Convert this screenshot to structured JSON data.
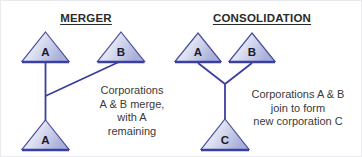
{
  "figure": {
    "title_left": "MERGER",
    "title_right": "CONSOLIDATION"
  },
  "colors": {
    "triangle_fill_light": "#e6e8f5",
    "triangle_fill_dark": "#aab0da",
    "triangle_stroke": "#4a4f9c",
    "triangle_base": "#3b3fa0",
    "connector_line": "#3b3f9e",
    "heading_text": "#2b2b2b",
    "caption_text": "#3a3a3a",
    "background": "#ffffff"
  },
  "merger": {
    "heading": "MERGER",
    "nodes": [
      {
        "id": "merger-node-a-top",
        "label": "A"
      },
      {
        "id": "merger-node-b-top",
        "label": "B"
      },
      {
        "id": "merger-node-a-bottom",
        "label": "A"
      }
    ],
    "caption_lines": [
      "Corporations",
      "A & B merge,",
      "with A",
      "remaining"
    ]
  },
  "consolidation": {
    "heading": "CONSOLIDATION",
    "nodes": [
      {
        "id": "consolidation-node-a",
        "label": "A"
      },
      {
        "id": "consolidation-node-b",
        "label": "B"
      },
      {
        "id": "consolidation-node-c",
        "label": "C"
      }
    ],
    "caption_lines": [
      "Corporations A & B",
      "join to form",
      "new corporation C"
    ]
  }
}
